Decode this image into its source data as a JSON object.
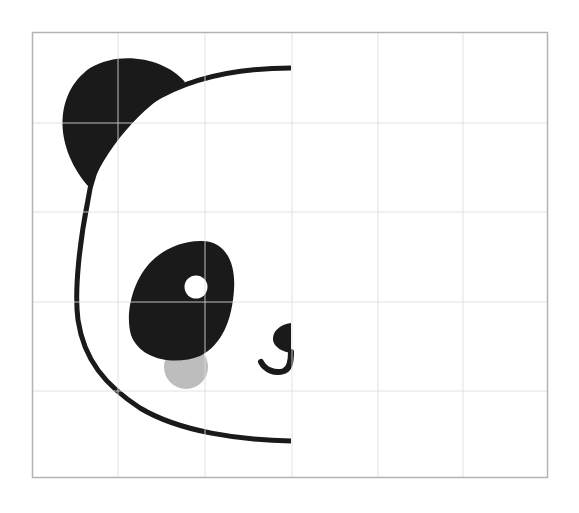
{
  "figure": {
    "colors": {
      "background": "#ffffff",
      "grid_line": "#e2e2e2",
      "frame": "#b3b3b3",
      "fill": "#1a1a1a",
      "cheek": "#bdbdbd",
      "pupil": "#ffffff"
    },
    "grid": {
      "left": 32,
      "top": 32,
      "right": 548,
      "bottom": 478,
      "columns": 6,
      "rows": 5,
      "vertical_lines": [
        118,
        205,
        292,
        378,
        463
      ],
      "horizontal_lines": [
        123,
        212,
        302,
        391
      ]
    }
  }
}
